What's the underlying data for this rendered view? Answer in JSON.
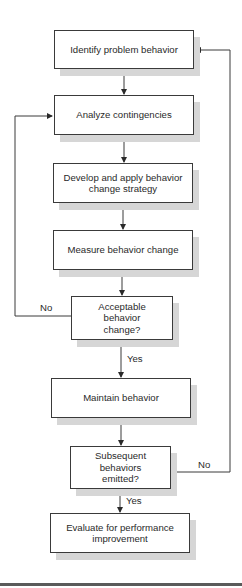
{
  "diagram": {
    "type": "flowchart",
    "nodes": [
      {
        "id": "n1",
        "label": "Identify problem behavior",
        "shape": "process"
      },
      {
        "id": "n2",
        "label": "Analyze contingencies",
        "shape": "process"
      },
      {
        "id": "n3",
        "label": "Develop and apply behavior change strategy",
        "shape": "process"
      },
      {
        "id": "n4",
        "label": "Measure behavior change",
        "shape": "process"
      },
      {
        "id": "d1",
        "label": "Acceptable behavior change?",
        "shape": "decision"
      },
      {
        "id": "n5",
        "label": "Maintain behavior",
        "shape": "process"
      },
      {
        "id": "d2",
        "label": "Subsequent behaviors emitted?",
        "shape": "decision"
      },
      {
        "id": "n6",
        "label": "Evaluate for performance improvement",
        "shape": "process"
      }
    ],
    "edges": [
      {
        "from": "n1",
        "to": "n2",
        "label": ""
      },
      {
        "from": "n2",
        "to": "n3",
        "label": ""
      },
      {
        "from": "n3",
        "to": "n4",
        "label": ""
      },
      {
        "from": "n4",
        "to": "d1",
        "label": ""
      },
      {
        "from": "d1",
        "to": "n2",
        "label": "No"
      },
      {
        "from": "d1",
        "to": "n5",
        "label": "Yes"
      },
      {
        "from": "n5",
        "to": "d2",
        "label": ""
      },
      {
        "from": "d2",
        "to": "n1",
        "label": "No"
      },
      {
        "from": "d2",
        "to": "n6",
        "label": "Yes"
      }
    ]
  },
  "labels": {
    "d1_no": "No",
    "d1_yes": "Yes",
    "d2_no": "No",
    "d2_yes": "Yes"
  },
  "colors": {
    "line": "#3a3a3a",
    "shadow": "#d6d6d6",
    "background": "#ffffff"
  }
}
